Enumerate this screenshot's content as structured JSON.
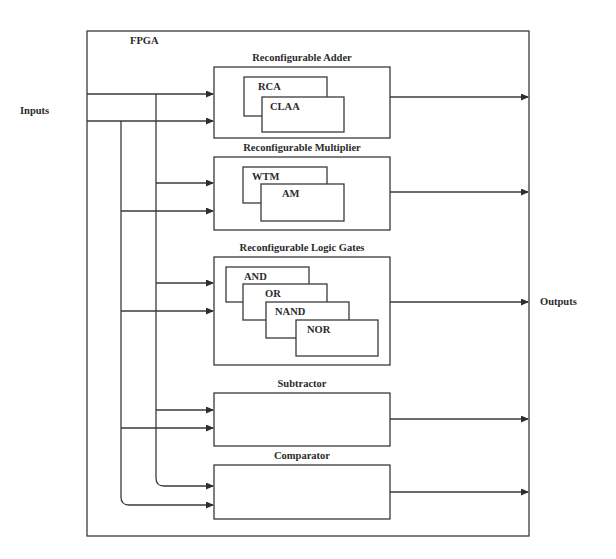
{
  "diagram": {
    "container_label": "FPGA",
    "inputs_label": "Inputs",
    "outputs_label": "Outputs",
    "blocks": [
      {
        "title": "Reconfigurable Adder",
        "units": [
          "RCA",
          "CLAA"
        ]
      },
      {
        "title": "Reconfigurable Multiplier",
        "units": [
          "WTM",
          "AM"
        ]
      },
      {
        "title": "Reconfigurable Logic Gates",
        "units": [
          "AND",
          "OR",
          "NAND",
          "NOR"
        ]
      },
      {
        "title": "Subtractor",
        "units": []
      },
      {
        "title": "Comparator",
        "units": []
      }
    ]
  },
  "colors": {
    "line": "#3a3a3a",
    "text": "#2b2b2b",
    "background": "#ffffff"
  }
}
